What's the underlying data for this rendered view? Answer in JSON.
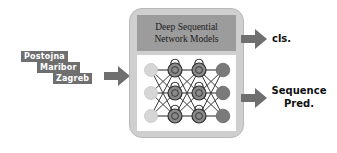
{
  "diagram": {
    "title_visible": false,
    "background_color": "#ffffff",
    "input_sequence": {
      "name": "input-city-sequence",
      "token_bg_color": "#6f6f6f",
      "token_text_color": "#ffffff",
      "tokens": [
        {
          "label": "Postojna"
        },
        {
          "label": "Maribor"
        },
        {
          "label": "Zagreb"
        }
      ]
    },
    "arrows": {
      "input_arrow": {
        "name": "input-arrow",
        "color": "#6f6f6f",
        "direction": "right"
      },
      "cls_arrow": {
        "name": "cls-output-arrow",
        "color": "#6f6f6f",
        "direction": "right"
      },
      "sequence_arrow": {
        "name": "sequence-output-arrow",
        "color": "#6f6f6f",
        "direction": "right"
      }
    },
    "model_panel": {
      "name": "deep-sequential-network-models-panel",
      "panel_color": "#cfcfcf",
      "header_color": "#9c9c9c",
      "header_line_1": "Deep Sequential",
      "header_line_2": "Network Models",
      "network": {
        "name": "recurrent-network-graph",
        "background_color": "#ffffff",
        "layers": [
          {
            "name": "input-layer",
            "node_count": 3,
            "node_color": "#d6d6d6",
            "recurrent": false
          },
          {
            "name": "hidden-layer-1",
            "node_count": 3,
            "node_color": "#8a8a8a",
            "recurrent": true
          },
          {
            "name": "hidden-layer-2",
            "node_count": 3,
            "node_color": "#8a8a8a",
            "recurrent": true
          },
          {
            "name": "output-layer",
            "node_count": 3,
            "node_color": "#7a7a7a",
            "recurrent": false
          }
        ],
        "edge_color": "#3a3a3a",
        "self_loop": true
      }
    },
    "outputs": [
      {
        "name": "cls-output-label",
        "lines": [
          "cls."
        ]
      },
      {
        "name": "sequence-pred-output-label",
        "lines": [
          "Sequence",
          "Pred."
        ]
      }
    ]
  }
}
